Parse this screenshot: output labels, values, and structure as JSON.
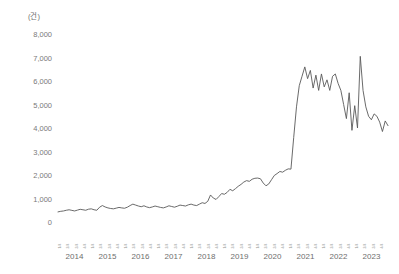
{
  "chart_data": {
    "type": "line",
    "title": "",
    "subtitle": "",
    "unit_label": "(건)",
    "xlabel": "",
    "ylabel": "",
    "ylim": [
      0,
      8000
    ],
    "ytick_labels": [
      "8,000",
      "7,000",
      "6,000",
      "5,000",
      "4,000",
      "3,000",
      "2,000",
      "1,000",
      "0"
    ],
    "ytick_values": [
      8000,
      7000,
      6000,
      5000,
      4000,
      3000,
      2000,
      1000,
      0
    ],
    "grid": false,
    "legend": "none",
    "line_color": "#595959",
    "line_width": 0.9,
    "x_axis_type": "quarterly",
    "year_labels": [
      "2014",
      "2015",
      "2016",
      "2017",
      "2018",
      "2019",
      "2020",
      "2021",
      "2022",
      "2023"
    ],
    "quarter_tick_label": "1/4",
    "quarter_tick_labels": [
      "1/4",
      "2/4",
      "3/4",
      "4/4",
      "1/4",
      "2/4",
      "3/4",
      "4/4",
      "1/4",
      "2/4",
      "3/4",
      "4/4",
      "1/4",
      "2/4",
      "3/4",
      "4/4",
      "1/4",
      "2/4",
      "3/4",
      "4/4",
      "1/4",
      "2/4",
      "3/4",
      "4/4",
      "1/4",
      "2/4",
      "3/4",
      "4/4",
      "1/4",
      "2/4",
      "3/4",
      "4/4",
      "1/4",
      "2/4",
      "3/4",
      "4/4",
      "1/4",
      "2/4",
      "3/4",
      "4/4"
    ],
    "x_start": "2014-01",
    "x_end": "2023-12",
    "x_period": "month",
    "values": [
      430,
      455,
      470,
      500,
      520,
      495,
      470,
      505,
      540,
      520,
      500,
      545,
      560,
      520,
      500,
      630,
      700,
      640,
      600,
      575,
      560,
      590,
      620,
      600,
      585,
      630,
      700,
      760,
      720,
      680,
      650,
      690,
      640,
      610,
      640,
      680,
      650,
      620,
      600,
      640,
      690,
      660,
      630,
      670,
      720,
      700,
      680,
      730,
      760,
      720,
      700,
      760,
      820,
      790,
      880,
      1150,
      1020,
      960,
      1080,
      1210,
      1180,
      1260,
      1390,
      1330,
      1420,
      1520,
      1600,
      1700,
      1760,
      1730,
      1820,
      1860,
      1870,
      1840,
      1660,
      1540,
      1620,
      1800,
      1980,
      2060,
      2150,
      2120,
      2200,
      2260,
      2250,
      3600,
      4900,
      5800,
      6200,
      6600,
      6100,
      6450,
      5700,
      6250,
      5600,
      6300,
      5750,
      6050,
      5600,
      6200,
      6300,
      5900,
      5600,
      5000,
      4400,
      5500,
      3900,
      4950,
      4000,
      7050,
      5600,
      4900,
      4500,
      4350,
      4600,
      4500,
      4250,
      3850,
      4300,
      4100
    ]
  }
}
